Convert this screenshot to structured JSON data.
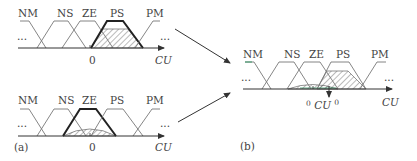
{
  "figure": {
    "panel_a_label": "(a)",
    "panel_b_label": "(b)",
    "sets": [
      "NM",
      "NS",
      "ZE",
      "PS",
      "PM"
    ],
    "top": {
      "title": "PS activated",
      "labels": {
        "nm": "NM",
        "ns": "NS",
        "ze": "ZE",
        "ps": "PS",
        "pm": "PM"
      },
      "zero": "0",
      "axis_label": "CU",
      "ellipsis_left": "...",
      "ellipsis_right": "...",
      "highlighted_set": "PS"
    },
    "bottom": {
      "labels": {
        "nm": "NM",
        "ns": "NS",
        "ze": "ZE",
        "ps": "PS",
        "pm": "PM"
      },
      "zero": "0",
      "axis_label": "CU",
      "ellipsis_left": "...",
      "ellipsis_right": "...",
      "highlighted_set": "ZE"
    },
    "combined": {
      "labels": {
        "nm": "NM",
        "ns": "NS",
        "ze": "ZE",
        "ps": "PS",
        "pm": "PM"
      },
      "output_prefix": "0",
      "output_main": "CU",
      "output_super": "0",
      "axis_label": "CU",
      "ellipsis_left": "...",
      "ellipsis_right": "..."
    },
    "colors": {
      "line": "#777777",
      "bold": "#222222",
      "hatch": "#555555",
      "accent_green": "#3a9a6a"
    }
  }
}
